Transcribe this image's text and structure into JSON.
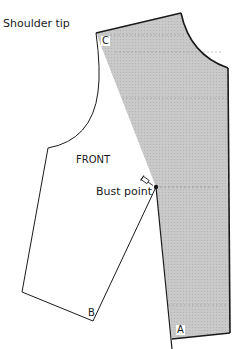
{
  "diagram": {
    "labels": {
      "shoulder_tip": "Shoulder tip",
      "front": "FRONT",
      "bust_point": "Bust point"
    },
    "points": {
      "c": "C",
      "b": "B",
      "a": "A"
    },
    "colors": {
      "shaded_piece": "#c8c8c8",
      "outline": "#1a1a1a",
      "background": "#ffffff"
    }
  }
}
